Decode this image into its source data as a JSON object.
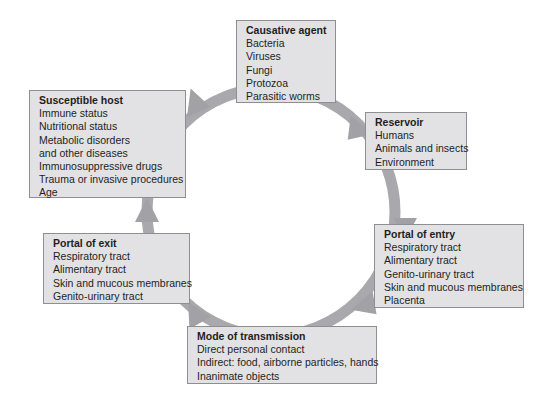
{
  "diagram": {
    "type": "cycle",
    "ring_color": "#a8a8ac",
    "box_fill": "#e2e2e4",
    "nodes": [
      {
        "id": "causative",
        "title": "Causative agent",
        "items": [
          "Bacteria",
          "Viruses",
          "Fungi",
          "Protozoa",
          "Parasitic worms"
        ]
      },
      {
        "id": "reservoir",
        "title": "Reservoir",
        "items": [
          "Humans",
          "Animals and insects",
          "Environment"
        ]
      },
      {
        "id": "entry",
        "title": "Portal of entry",
        "items": [
          "Respiratory tract",
          "Alimentary tract",
          "Genito-urinary tract",
          "Skin and mucous membranes",
          "Placenta"
        ]
      },
      {
        "id": "transmission",
        "title": "Mode of transmission",
        "items": [
          "Direct personal contact",
          "Indirect: food, airborne particles, hands",
          "Inanimate objects"
        ]
      },
      {
        "id": "exit",
        "title": "Portal of exit",
        "items": [
          "Respiratory tract",
          "Alimentary tract",
          "Skin and mucous membranes",
          "Genito-urinary tract"
        ]
      },
      {
        "id": "host",
        "title": "Susceptible host",
        "items": [
          "Immune status",
          "Nutritional status",
          "Metabolic disorders",
          "and other diseases",
          "Immunosuppressive drugs",
          "Trauma or invasive procedures",
          "Age"
        ]
      }
    ],
    "edges": [
      [
        "causative",
        "reservoir"
      ],
      [
        "reservoir",
        "entry"
      ],
      [
        "entry",
        "transmission"
      ],
      [
        "transmission",
        "exit"
      ],
      [
        "exit",
        "host"
      ],
      [
        "host",
        "causative"
      ]
    ]
  }
}
